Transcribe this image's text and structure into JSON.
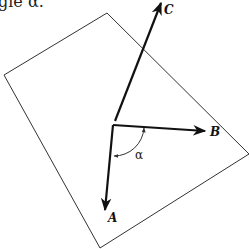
{
  "caption": "gle α.",
  "diagram": {
    "plane": {
      "points": "107,13 4,75 100,248 249,154",
      "stroke": "#333333"
    },
    "origin": {
      "x": 113,
      "y": 125
    },
    "vectors": [
      {
        "name": "C",
        "label": "C",
        "tip": {
          "x": 161,
          "y": 3
        },
        "label_pos": {
          "x": 164,
          "y": 14
        }
      },
      {
        "name": "B",
        "label": "B",
        "tip": {
          "x": 205,
          "y": 131
        },
        "label_pos": {
          "x": 210,
          "y": 136
        }
      },
      {
        "name": "A",
        "label": "A",
        "tip": {
          "x": 105,
          "y": 210
        },
        "label_pos": {
          "x": 108,
          "y": 222
        }
      }
    ],
    "angle": {
      "label": "α",
      "label_pos": {
        "x": 135,
        "y": 159
      }
    }
  }
}
